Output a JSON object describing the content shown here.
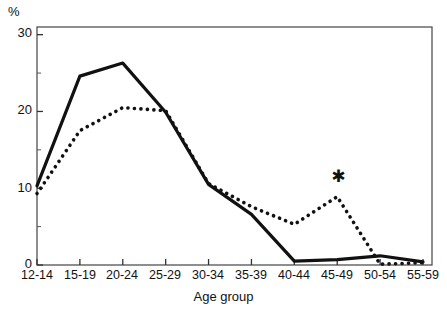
{
  "chart_data": {
    "type": "line",
    "title": "",
    "xlabel": "Age group",
    "ylabel": "%",
    "categories": [
      "12-14",
      "15-19",
      "20-24",
      "25-29",
      "30-34",
      "35-39",
      "40-44",
      "45-49",
      "50-54",
      "55-59"
    ],
    "ylim": [
      0,
      31
    ],
    "yticks_major": [
      0,
      10,
      20,
      30
    ],
    "yticks_minor": [
      5,
      15,
      25
    ],
    "grid": false,
    "legend": "none",
    "series": [
      {
        "name": "solid-line",
        "style": "solid",
        "color": "#111111",
        "values": [
          10.3,
          24.6,
          26.3,
          19.9,
          10.5,
          6.6,
          0.5,
          0.7,
          1.2,
          0.4
        ]
      },
      {
        "name": "dotted-line",
        "style": "dotted",
        "color": "#111111",
        "values": [
          9.3,
          17.5,
          20.5,
          20.1,
          10.6,
          7.6,
          5.3,
          8.9,
          0.1,
          0.3
        ]
      }
    ],
    "annotations": [
      {
        "name": "significance-asterisk",
        "symbol": "★",
        "category": "45-49",
        "value": 11.5
      }
    ]
  },
  "axis": {
    "unit_label": "%",
    "y_labels": [
      "30",
      "20",
      "10",
      "0"
    ],
    "x_title": "Age group"
  }
}
